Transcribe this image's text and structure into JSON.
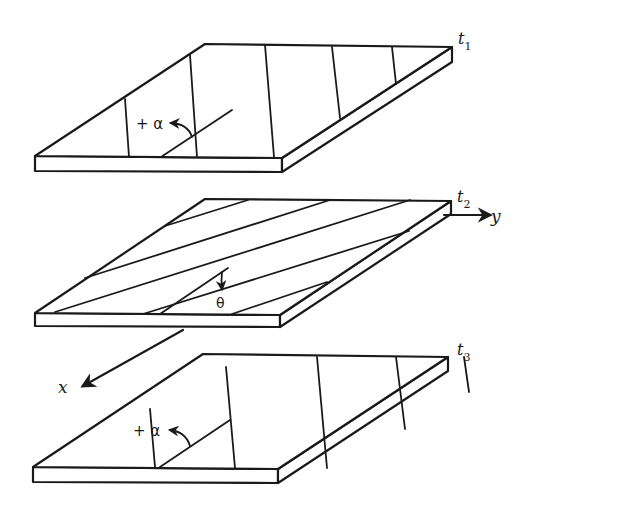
{
  "diagram": {
    "plies": [
      {
        "id": "t1",
        "label": "t",
        "subscript": "1",
        "angle_label": "+ α",
        "fiber_orientation": "+alpha (near-transverse)"
      },
      {
        "id": "t2",
        "label": "t",
        "subscript": "2",
        "angle_label": "θ",
        "fiber_orientation": "theta (near-axial)"
      },
      {
        "id": "t3",
        "label": "t",
        "subscript": "3",
        "angle_label": "+ α",
        "fiber_orientation": "+alpha (near-transverse)"
      }
    ],
    "axes": {
      "x": "x",
      "y": "y"
    },
    "colors": {
      "line": "#1a1a1a",
      "background": "#ffffff"
    }
  }
}
